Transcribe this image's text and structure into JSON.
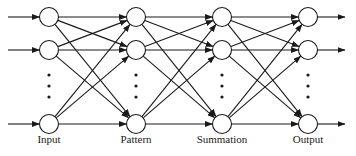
{
  "diagram": {
    "type": "neural-network",
    "layers": [
      {
        "label": "Input",
        "x": 49
      },
      {
        "label": "Pattern",
        "x": 136
      },
      {
        "label": "Summation",
        "x": 222
      },
      {
        "label": "Output",
        "x": 308
      }
    ],
    "rows_y": [
      17,
      50,
      124
    ],
    "ellipsis_y": [
      75,
      86,
      97
    ],
    "node_radius": 9.5,
    "label_y": 143,
    "input_arrow_start_x": 8,
    "output_arrow_end_x": 345,
    "stroke_color": "#1a1a1a",
    "node_fill": "#ffffff"
  }
}
